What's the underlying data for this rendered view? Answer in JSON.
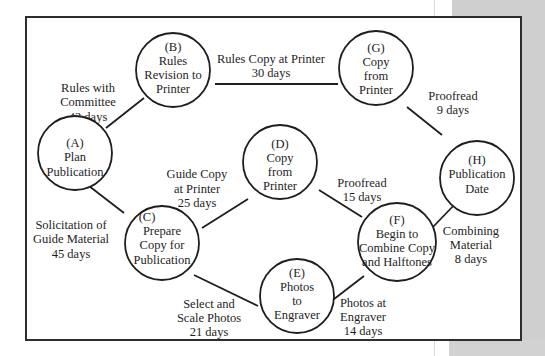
{
  "diagram": {
    "type": "network-flow",
    "title": "",
    "colors": {
      "line": "#1e1e1e",
      "frame": "#2e2e2e",
      "background": "#ffffff",
      "side_panel": "#cfcfcf"
    },
    "nodes": [
      {
        "id": "A",
        "tag": "(A)",
        "lines": [
          "Plan",
          "Publication"
        ]
      },
      {
        "id": "B",
        "tag": "(B)",
        "lines": [
          "Rules",
          "Revision to",
          "Printer"
        ]
      },
      {
        "id": "C",
        "tag": "(C)",
        "lines": [
          "Prepare",
          "Copy for",
          "Publication"
        ]
      },
      {
        "id": "D",
        "tag": "(D)",
        "lines": [
          "Copy",
          "from",
          "Printer"
        ]
      },
      {
        "id": "E",
        "tag": "(E)",
        "lines": [
          "Photos",
          "to",
          "Engraver"
        ]
      },
      {
        "id": "F",
        "tag": "(F)",
        "lines": [
          "Begin to",
          "Combine Copy",
          "and Halftones"
        ]
      },
      {
        "id": "G",
        "tag": "(G)",
        "lines": [
          "Copy",
          "from",
          "Printer"
        ]
      },
      {
        "id": "H",
        "tag": "(H)",
        "lines": [
          "Publication",
          "Date"
        ]
      }
    ],
    "edges": [
      {
        "from": "A",
        "to": "B",
        "lines": [
          "Rules with",
          "Committee",
          "42 days"
        ],
        "days": 42
      },
      {
        "from": "B",
        "to": "G",
        "lines": [
          "Rules Copy at Printer",
          "30 days"
        ],
        "days": 30
      },
      {
        "from": "G",
        "to": "H",
        "lines": [
          "Proofread",
          "9 days"
        ],
        "days": 9
      },
      {
        "from": "A",
        "to": "C",
        "lines": [
          "Solicitation of",
          "Guide Material",
          "45 days"
        ],
        "days": 45
      },
      {
        "from": "C",
        "to": "D",
        "lines": [
          "Guide Copy",
          "at Printer",
          "25 days"
        ],
        "days": 25
      },
      {
        "from": "D",
        "to": "F",
        "lines": [
          "Proofread",
          "15 days"
        ],
        "days": 15
      },
      {
        "from": "C",
        "to": "E",
        "lines": [
          "Select and",
          "Scale Photos",
          "21 days"
        ],
        "days": 21
      },
      {
        "from": "E",
        "to": "F",
        "lines": [
          "Photos at",
          "Engraver",
          "14 days"
        ],
        "days": 14
      },
      {
        "from": "F",
        "to": "H",
        "lines": [
          "Combining",
          "Material",
          "8 days"
        ],
        "days": 8
      }
    ]
  }
}
